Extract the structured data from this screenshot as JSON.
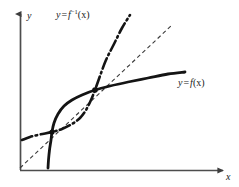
{
  "figure": {
    "background_color": "#ffffff",
    "ink_color": "#1a1a1a",
    "axis_color": "#4d4d4d",
    "width": 239,
    "height": 187
  },
  "axes": {
    "y_axis_label": "y",
    "x_axis_label": "x",
    "origin": {
      "x": 20,
      "y": 170
    },
    "x_axis_end": {
      "x": 225,
      "y": 170
    },
    "y_axis_end": {
      "x": 20,
      "y": 12
    }
  },
  "labels": {
    "inverse": {
      "lhs": "y",
      "equals": "=",
      "fn": "f",
      "exponent": "−1",
      "arg": "(x)",
      "full": "y = f⁻¹(x)"
    },
    "function": {
      "lhs": "y",
      "equals": "=",
      "fn": "f",
      "arg": "(x)",
      "full": "y = f(x)"
    }
  },
  "chart_data": {
    "type": "line",
    "title": "",
    "xlabel": "x",
    "ylabel": "y",
    "grid": false,
    "legend": "inline-annotations",
    "axis_style": "arrowed-open-axes",
    "xlim": [
      0,
      239
    ],
    "ylim": [
      0,
      187
    ],
    "note": "Pixel coordinates, y measured downward from top of 239x187 image.",
    "series": [
      {
        "name": "y = f(x)",
        "style": "solid",
        "stroke_width": 2.8,
        "color": "#141414",
        "points": [
          [
            48,
            168
          ],
          [
            48.5,
            160
          ],
          [
            49.5,
            150
          ],
          [
            51,
            140
          ],
          [
            52,
            132
          ],
          [
            54,
            123
          ],
          [
            58,
            114
          ],
          [
            64,
            106
          ],
          [
            72,
            100
          ],
          [
            82,
            95
          ],
          [
            95,
            90
          ],
          [
            110,
            86
          ],
          [
            128,
            82
          ],
          [
            148,
            78
          ],
          [
            168,
            74
          ],
          [
            185,
            72
          ]
        ]
      },
      {
        "name": "y = f⁻¹(x)",
        "style": "dash-dot",
        "stroke_width": 2.6,
        "color": "#141414",
        "dasharray": "11,3.5,1.6,3.5",
        "points": [
          [
            22,
            140
          ],
          [
            30,
            137
          ],
          [
            40,
            134.5
          ],
          [
            52,
            132
          ],
          [
            62,
            129
          ],
          [
            72,
            124
          ],
          [
            80,
            118
          ],
          [
            86,
            110
          ],
          [
            91,
            100
          ],
          [
            95,
            90
          ],
          [
            100,
            76
          ],
          [
            106,
            60
          ],
          [
            114,
            44
          ],
          [
            122,
            28
          ],
          [
            130,
            15
          ]
        ]
      },
      {
        "name": "y = x",
        "style": "dashed",
        "stroke_width": 1.1,
        "color": "#3a3a3a",
        "dasharray": "4,3",
        "points": [
          [
            20,
            168
          ],
          [
            172,
            25
          ]
        ]
      }
    ],
    "intersection_points": [
      {
        "label": "lower",
        "x": 52,
        "y": 132
      },
      {
        "label": "upper",
        "x": 95,
        "y": 90
      }
    ],
    "annotations": [
      {
        "text": "y = f⁻¹(x)",
        "x": 56,
        "y": 10,
        "attached_to": "y = f⁻¹(x)"
      },
      {
        "text": "y = f(x)",
        "x": 178,
        "y": 78,
        "attached_to": "y = f(x)"
      }
    ]
  }
}
